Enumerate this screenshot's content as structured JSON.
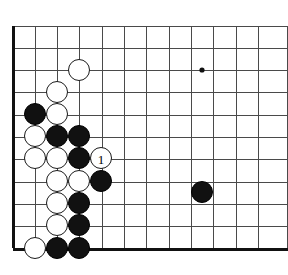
{
  "board": {
    "title": "Go board diagram",
    "background_color": "#ffffff",
    "line_color": "#4a4a4a",
    "edge_color": "#111111",
    "cols": 12,
    "rows": 11,
    "origin_x": 13,
    "origin_y": 26,
    "spacing": 22.3,
    "stone_radius": 11,
    "edge_left_x": 13,
    "edge_bottom_y": 248,
    "edge_thickness": 3,
    "line_thickness": 1,
    "star_points": [
      {
        "name": "star-point-upper-right",
        "x": 202,
        "y": 70
      }
    ],
    "black_color": "#111111",
    "white_color": "#ffffff"
  },
  "stones": [
    {
      "id": "w-d3",
      "color": "white",
      "x": 79,
      "y": 70,
      "label": ""
    },
    {
      "id": "w-c4",
      "color": "white",
      "x": 57,
      "y": 92,
      "label": ""
    },
    {
      "id": "b-b5",
      "color": "black",
      "x": 35,
      "y": 114,
      "label": ""
    },
    {
      "id": "w-c5",
      "color": "white",
      "x": 57,
      "y": 114,
      "label": ""
    },
    {
      "id": "w-b6",
      "color": "white",
      "x": 35,
      "y": 136,
      "label": ""
    },
    {
      "id": "b-c6",
      "color": "black",
      "x": 57,
      "y": 136,
      "label": ""
    },
    {
      "id": "b-d6",
      "color": "black",
      "x": 79,
      "y": 136,
      "label": ""
    },
    {
      "id": "w-b7",
      "color": "white",
      "x": 35,
      "y": 158,
      "label": ""
    },
    {
      "id": "w-c7",
      "color": "white",
      "x": 57,
      "y": 158,
      "label": ""
    },
    {
      "id": "b-d7",
      "color": "black",
      "x": 79,
      "y": 158,
      "label": ""
    },
    {
      "id": "w-e7",
      "color": "white",
      "x": 101,
      "y": 158,
      "label": "1"
    },
    {
      "id": "w-c8",
      "color": "white",
      "x": 57,
      "y": 181,
      "label": ""
    },
    {
      "id": "w-d8",
      "color": "white",
      "x": 79,
      "y": 181,
      "label": ""
    },
    {
      "id": "b-e8",
      "color": "black",
      "x": 101,
      "y": 181,
      "label": ""
    },
    {
      "id": "w-c9",
      "color": "white",
      "x": 57,
      "y": 203,
      "label": ""
    },
    {
      "id": "b-d9",
      "color": "black",
      "x": 79,
      "y": 203,
      "label": ""
    },
    {
      "id": "w-c10",
      "color": "white",
      "x": 57,
      "y": 225,
      "label": ""
    },
    {
      "id": "b-d10",
      "color": "black",
      "x": 79,
      "y": 225,
      "label": ""
    },
    {
      "id": "w-b11",
      "color": "white",
      "x": 35,
      "y": 248,
      "label": ""
    },
    {
      "id": "b-c11",
      "color": "black",
      "x": 57,
      "y": 248,
      "label": ""
    },
    {
      "id": "b-d11",
      "color": "black",
      "x": 79,
      "y": 248,
      "label": ""
    },
    {
      "id": "b-j9",
      "color": "black",
      "x": 202,
      "y": 192,
      "label": ""
    }
  ],
  "move_markers": [
    {
      "number": "1",
      "stone_id": "w-e7"
    }
  ]
}
